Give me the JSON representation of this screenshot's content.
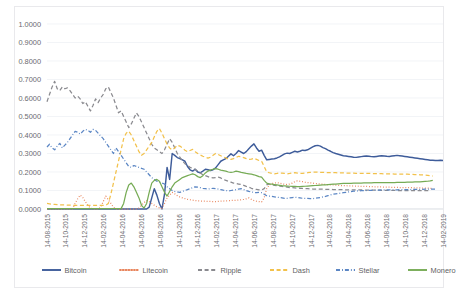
{
  "chart_data": {
    "type": "line",
    "title": "",
    "subtitle": "",
    "xlabel": "",
    "ylabel": "",
    "ylim": [
      0.0,
      1.0
    ],
    "ytick_step": 0.1,
    "grid": true,
    "legend_position": "bottom",
    "ytick_labels": [
      "0.0000",
      "0.1000",
      "0.2000",
      "0.3000",
      "0.4000",
      "0.5000",
      "0.6000",
      "0.7000",
      "0.8000",
      "0.9000",
      "1.0000"
    ],
    "ytick_values": [
      0.0,
      0.1,
      0.2,
      0.3,
      0.4,
      0.5,
      0.6,
      0.7,
      0.8,
      0.9,
      1.0
    ],
    "xtick_labels": [
      "14-08-2015",
      "14-10-2015",
      "14-12-2015",
      "14-02-2016",
      "14-04-2016",
      "14-06-2016",
      "14-08-2016",
      "14-10-2016",
      "14-12-2016",
      "14-02-2017",
      "14-04-2017",
      "14-06-2017",
      "14-08-2017",
      "14-10-2017",
      "14-12-2017",
      "14-02-2018",
      "14-04-2018",
      "14-06-2018",
      "14-08-2018",
      "14-10-2018",
      "14-12-2018",
      "14-02-2019"
    ],
    "x_count": 22,
    "colors": {
      "Bitcoin": "#3e5c9a",
      "Litecoin": "#e8835a",
      "Ripple": "#8a8a8f",
      "Dash": "#f2c14b",
      "Stellar": "#5b86c4",
      "Monero": "#76ab55"
    },
    "series": [
      {
        "name": "Bitcoin",
        "color": "#3e5c9a",
        "dash": "solid",
        "values": [
          0.0,
          0.0,
          0.0,
          0.0,
          0.0,
          0.0,
          0.0,
          0.0,
          0.0,
          0.0,
          0.0,
          0.0,
          0.0,
          0.0,
          0.0,
          0.0,
          0.0,
          0.0,
          0.0,
          0.0,
          0.0,
          0.0,
          0.0,
          0.0,
          0.0,
          0.0,
          0.0,
          0.0,
          0.0,
          0.0,
          0.0,
          0.0,
          0.0,
          0.0,
          0.0,
          0.0,
          0.0,
          0.0,
          0.0,
          0.0,
          0.01,
          0.06,
          0.11,
          0.075,
          0.03,
          0.0,
          0.08,
          0.225,
          0.16,
          0.3,
          0.29,
          0.278,
          0.272,
          0.265,
          0.258,
          0.23,
          0.212,
          0.205,
          0.215,
          0.2,
          0.196,
          0.205,
          0.215,
          0.212,
          0.208,
          0.212,
          0.222,
          0.24,
          0.258,
          0.265,
          0.272,
          0.285,
          0.298,
          0.288,
          0.3,
          0.316,
          0.308,
          0.3,
          0.31,
          0.326,
          0.34,
          0.352,
          0.33,
          0.312,
          0.318,
          0.29,
          0.266,
          0.268,
          0.27,
          0.272,
          0.276,
          0.282,
          0.29,
          0.298,
          0.302,
          0.3,
          0.306,
          0.312,
          0.308,
          0.312,
          0.318,
          0.316,
          0.32,
          0.328,
          0.336,
          0.342,
          0.344,
          0.34,
          0.332,
          0.326,
          0.318,
          0.312,
          0.305,
          0.3,
          0.296,
          0.292,
          0.288,
          0.286,
          0.284,
          0.282,
          0.28,
          0.279,
          0.281,
          0.283,
          0.285,
          0.287,
          0.285,
          0.283,
          0.282,
          0.284,
          0.286,
          0.288,
          0.287,
          0.285,
          0.284,
          0.286,
          0.288,
          0.29,
          0.288,
          0.286,
          0.284,
          0.282,
          0.28,
          0.278,
          0.276,
          0.274,
          0.272,
          0.27,
          0.268,
          0.266,
          0.264,
          0.263,
          0.262,
          0.262,
          0.263,
          0.262
        ]
      },
      {
        "name": "Litecoin",
        "color": "#e8835a",
        "dash": "dotted",
        "values": [
          0.0,
          0.0,
          0.0,
          0.0,
          0.0,
          0.0,
          0.0,
          0.0,
          0.0,
          0.0,
          0.0,
          0.03,
          0.055,
          0.075,
          0.062,
          0.04,
          0.02,
          0.005,
          0.0,
          0.0,
          0.0,
          0.01,
          0.04,
          0.07,
          0.05,
          0.03,
          0.01,
          0.0,
          0.0,
          0.0,
          0.0,
          0.0,
          0.0,
          0.0,
          0.0,
          0.0,
          0.005,
          0.02,
          0.035,
          0.045,
          0.04,
          0.03,
          0.02,
          0.012,
          0.006,
          0.004,
          0.03,
          0.06,
          0.075,
          0.09,
          0.082,
          0.072,
          0.065,
          0.06,
          0.056,
          0.052,
          0.05,
          0.048,
          0.046,
          0.044,
          0.043,
          0.042,
          0.042,
          0.041,
          0.041,
          0.04,
          0.04,
          0.041,
          0.042,
          0.043,
          0.044,
          0.045,
          0.046,
          0.046,
          0.047,
          0.048,
          0.05,
          0.052,
          0.055,
          0.06,
          0.052,
          0.046,
          0.042,
          0.04,
          0.038,
          0.06,
          0.11,
          0.13,
          0.138,
          0.14,
          0.142,
          0.14,
          0.136,
          0.134,
          0.132,
          0.135,
          0.14,
          0.148,
          0.152,
          0.15,
          0.148,
          0.145,
          0.143,
          0.142,
          0.14,
          0.138,
          0.136,
          0.135,
          0.134,
          0.133,
          0.132,
          0.131,
          0.13,
          0.129,
          0.128,
          0.127,
          0.126,
          0.126,
          0.125,
          0.125,
          0.124,
          0.124,
          0.123,
          0.123,
          0.122,
          0.122,
          0.121,
          0.121,
          0.12,
          0.12,
          0.119,
          0.119,
          0.118,
          0.118,
          0.118,
          0.117,
          0.117,
          0.117,
          0.116,
          0.116,
          0.116,
          0.115,
          0.115,
          0.115,
          0.114,
          0.114,
          0.114,
          0.113,
          0.113,
          0.113,
          0.112,
          0.112
        ]
      },
      {
        "name": "Ripple",
        "color": "#8a8a8f",
        "dash": "dashed",
        "values": [
          0.58,
          0.62,
          0.66,
          0.69,
          0.65,
          0.64,
          0.66,
          0.65,
          0.655,
          0.64,
          0.62,
          0.6,
          0.61,
          0.595,
          0.57,
          0.58,
          0.555,
          0.53,
          0.56,
          0.595,
          0.575,
          0.6,
          0.62,
          0.65,
          0.66,
          0.63,
          0.6,
          0.56,
          0.52,
          0.53,
          0.5,
          0.47,
          0.44,
          0.46,
          0.49,
          0.52,
          0.5,
          0.47,
          0.44,
          0.41,
          0.38,
          0.35,
          0.33,
          0.32,
          0.31,
          0.3,
          0.32,
          0.35,
          0.38,
          0.36,
          0.33,
          0.3,
          0.28,
          0.26,
          0.245,
          0.235,
          0.225,
          0.22,
          0.215,
          0.205,
          0.195,
          0.185,
          0.18,
          0.175,
          0.17,
          0.168,
          0.17,
          0.172,
          0.168,
          0.16,
          0.155,
          0.15,
          0.145,
          0.14,
          0.138,
          0.135,
          0.132,
          0.128,
          0.122,
          0.118,
          0.112,
          0.108,
          0.106,
          0.104,
          0.102,
          0.11,
          0.13,
          0.135,
          0.132,
          0.128,
          0.126,
          0.124,
          0.122,
          0.12,
          0.118,
          0.116,
          0.115,
          0.114,
          0.113,
          0.112,
          0.111,
          0.11,
          0.11,
          0.109,
          0.108,
          0.108,
          0.108,
          0.107,
          0.107,
          0.106,
          0.106,
          0.106,
          0.105,
          0.105,
          0.105,
          0.105,
          0.104,
          0.104,
          0.104,
          0.104,
          0.103,
          0.103,
          0.103,
          0.103,
          0.103,
          0.102,
          0.102,
          0.102,
          0.102,
          0.102,
          0.102,
          0.101,
          0.101,
          0.101,
          0.101,
          0.101,
          0.101,
          0.1,
          0.1,
          0.1,
          0.1,
          0.1,
          0.1,
          0.1,
          0.1,
          0.099,
          0.099,
          0.099,
          0.099,
          0.099,
          0.099
        ]
      },
      {
        "name": "Dash",
        "color": "#f2c14b",
        "dash": "dashed",
        "values": [
          0.03,
          0.028,
          0.026,
          0.025,
          0.024,
          0.023,
          0.022,
          0.022,
          0.021,
          0.021,
          0.02,
          0.02,
          0.02,
          0.02,
          0.02,
          0.02,
          0.02,
          0.02,
          0.02,
          0.02,
          0.02,
          0.02,
          0.02,
          0.02,
          0.03,
          0.08,
          0.14,
          0.2,
          0.26,
          0.32,
          0.38,
          0.41,
          0.42,
          0.4,
          0.37,
          0.34,
          0.31,
          0.29,
          0.3,
          0.32,
          0.34,
          0.36,
          0.39,
          0.42,
          0.435,
          0.41,
          0.38,
          0.35,
          0.33,
          0.32,
          0.33,
          0.345,
          0.34,
          0.33,
          0.318,
          0.31,
          0.316,
          0.322,
          0.31,
          0.3,
          0.292,
          0.285,
          0.28,
          0.275,
          0.28,
          0.29,
          0.3,
          0.295,
          0.288,
          0.282,
          0.276,
          0.27,
          0.268,
          0.272,
          0.278,
          0.285,
          0.282,
          0.278,
          0.272,
          0.268,
          0.27,
          0.274,
          0.268,
          0.262,
          0.258,
          0.23,
          0.2,
          0.196,
          0.192,
          0.19,
          0.192,
          0.195,
          0.194,
          0.192,
          0.19,
          0.192,
          0.195,
          0.196,
          0.194,
          0.192,
          0.193,
          0.195,
          0.196,
          0.198,
          0.2,
          0.2,
          0.199,
          0.198,
          0.198,
          0.197,
          0.197,
          0.196,
          0.196,
          0.196,
          0.195,
          0.195,
          0.195,
          0.194,
          0.194,
          0.194,
          0.194,
          0.193,
          0.193,
          0.193,
          0.192,
          0.192,
          0.192,
          0.192,
          0.191,
          0.191,
          0.191,
          0.191,
          0.19,
          0.19,
          0.19,
          0.19,
          0.189,
          0.189,
          0.189,
          0.188,
          0.188,
          0.188,
          0.187,
          0.187,
          0.186,
          0.186,
          0.185,
          0.184,
          0.183,
          0.182,
          0.18,
          0.178
        ]
      },
      {
        "name": "Stellar",
        "color": "#5b86c4",
        "dash": "dashdot",
        "values": [
          0.335,
          0.35,
          0.33,
          0.32,
          0.34,
          0.355,
          0.33,
          0.345,
          0.36,
          0.38,
          0.4,
          0.42,
          0.415,
          0.405,
          0.42,
          0.43,
          0.425,
          0.415,
          0.43,
          0.425,
          0.41,
          0.395,
          0.38,
          0.36,
          0.34,
          0.32,
          0.3,
          0.33,
          0.31,
          0.29,
          0.27,
          0.25,
          0.23,
          0.225,
          0.235,
          0.23,
          0.225,
          0.22,
          0.215,
          0.2,
          0.185,
          0.17,
          0.16,
          0.15,
          0.145,
          0.14,
          0.135,
          0.12,
          0.11,
          0.1,
          0.095,
          0.092,
          0.09,
          0.095,
          0.1,
          0.105,
          0.11,
          0.115,
          0.12,
          0.118,
          0.115,
          0.112,
          0.11,
          0.108,
          0.11,
          0.112,
          0.11,
          0.108,
          0.105,
          0.102,
          0.1,
          0.098,
          0.1,
          0.102,
          0.105,
          0.108,
          0.11,
          0.105,
          0.1,
          0.095,
          0.092,
          0.09,
          0.088,
          0.09,
          0.088,
          0.08,
          0.072,
          0.07,
          0.068,
          0.066,
          0.064,
          0.062,
          0.06,
          0.058,
          0.058,
          0.06,
          0.062,
          0.064,
          0.062,
          0.06,
          0.058,
          0.058,
          0.057,
          0.056,
          0.056,
          0.058,
          0.06,
          0.062,
          0.065,
          0.068,
          0.072,
          0.076,
          0.08,
          0.082,
          0.084,
          0.086,
          0.088,
          0.09,
          0.092,
          0.094,
          0.096,
          0.097,
          0.098,
          0.099,
          0.1,
          0.1,
          0.101,
          0.101,
          0.102,
          0.102,
          0.102,
          0.103,
          0.103,
          0.103,
          0.104,
          0.104,
          0.104,
          0.104,
          0.105,
          0.105,
          0.105,
          0.105,
          0.105,
          0.106,
          0.106,
          0.106,
          0.106,
          0.106,
          0.107,
          0.107,
          0.107,
          0.107,
          0.107
        ]
      },
      {
        "name": "Monero",
        "color": "#76ab55",
        "dash": "solid-green",
        "values": [
          0.002,
          0.002,
          0.002,
          0.002,
          0.002,
          0.002,
          0.002,
          0.002,
          0.002,
          0.002,
          0.002,
          0.002,
          0.002,
          0.002,
          0.002,
          0.002,
          0.002,
          0.002,
          0.002,
          0.002,
          0.002,
          0.002,
          0.002,
          0.002,
          0.002,
          0.002,
          0.002,
          0.002,
          0.002,
          0.002,
          0.03,
          0.09,
          0.13,
          0.14,
          0.12,
          0.09,
          0.06,
          0.02,
          0.005,
          0.03,
          0.09,
          0.14,
          0.155,
          0.16,
          0.15,
          0.12,
          0.09,
          0.07,
          0.095,
          0.12,
          0.14,
          0.15,
          0.16,
          0.17,
          0.175,
          0.18,
          0.185,
          0.19,
          0.185,
          0.175,
          0.17,
          0.18,
          0.195,
          0.205,
          0.21,
          0.215,
          0.218,
          0.215,
          0.21,
          0.208,
          0.205,
          0.2,
          0.198,
          0.2,
          0.205,
          0.202,
          0.198,
          0.195,
          0.192,
          0.19,
          0.188,
          0.185,
          0.18,
          0.175,
          0.172,
          0.155,
          0.14,
          0.136,
          0.134,
          0.132,
          0.13,
          0.128,
          0.126,
          0.125,
          0.124,
          0.123,
          0.122,
          0.122,
          0.121,
          0.121,
          0.122,
          0.123,
          0.124,
          0.125,
          0.126,
          0.127,
          0.128,
          0.129,
          0.13,
          0.131,
          0.132,
          0.133,
          0.134,
          0.135,
          0.136,
          0.137,
          0.138,
          0.138,
          0.139,
          0.139,
          0.14,
          0.14,
          0.14,
          0.14,
          0.141,
          0.141,
          0.141,
          0.141,
          0.142,
          0.142,
          0.142,
          0.142,
          0.142,
          0.143,
          0.143,
          0.143,
          0.143,
          0.144,
          0.144,
          0.144,
          0.144,
          0.145,
          0.145,
          0.145,
          0.146,
          0.146,
          0.147,
          0.148,
          0.149,
          0.15,
          0.152,
          0.155
        ]
      }
    ],
    "legend": [
      {
        "label": "Bitcoin",
        "color": "#3e5c9a",
        "style": "solid"
      },
      {
        "label": "Litecoin",
        "color": "#e8835a",
        "style": "dotted"
      },
      {
        "label": "Ripple",
        "color": "#8a8a8f",
        "style": "dashed"
      },
      {
        "label": "Dash",
        "color": "#f2c14b",
        "style": "dashed"
      },
      {
        "label": "Stellar",
        "color": "#5b86c4",
        "style": "dashdot"
      },
      {
        "label": "Monero",
        "color": "#76ab55",
        "style": "solid"
      }
    ]
  }
}
